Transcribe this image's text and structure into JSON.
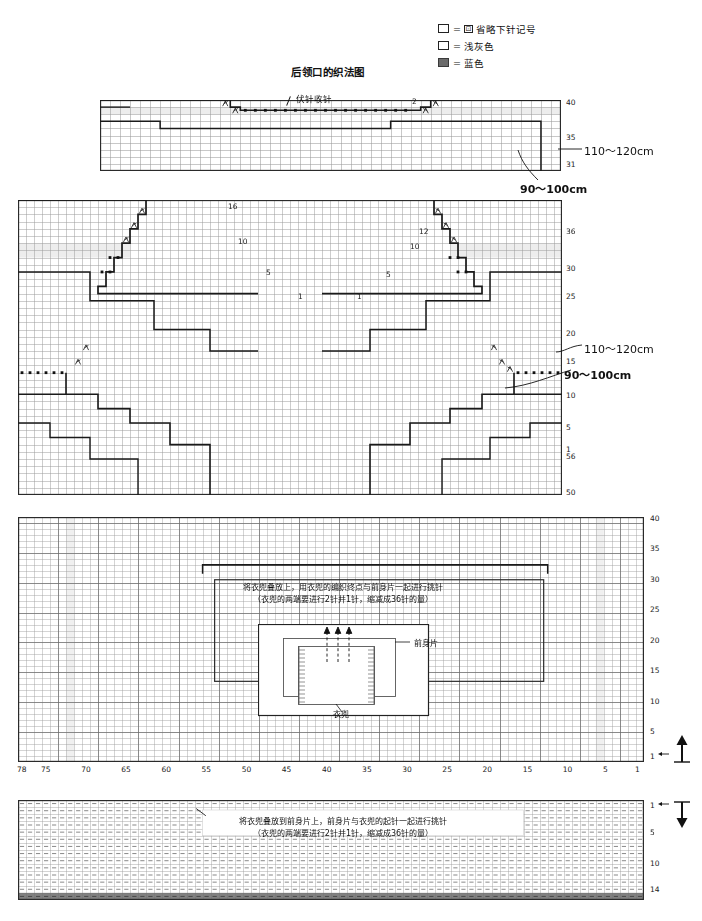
{
  "legend": {
    "rows": [
      {
        "swatch": "empty",
        "eq": "=",
        "mini": "⊡",
        "text": "省略下针记号"
      },
      {
        "swatch": "empty",
        "eq": "=",
        "mini": "",
        "text": "浅灰色"
      },
      {
        "swatch": "blue",
        "eq": "=",
        "mini": "",
        "text": "蓝色"
      }
    ],
    "blue_hex": "#6b6b6b"
  },
  "charts": [
    {
      "id": "back-neck",
      "title": "后领口的织法图",
      "annotations": [
        {
          "name": "bind-off",
          "text": "伏针收针"
        },
        {
          "name": "stitch-count-2",
          "text": "2"
        }
      ],
      "row_labels": [
        "40",
        "35",
        "31"
      ],
      "measure_right": "110～120cm",
      "measure_bottom": "90～100cm"
    },
    {
      "id": "front-body",
      "title": "前身片的织法图",
      "left_counts": [
        "16",
        "10",
        "5",
        "1"
      ],
      "right_counts": [
        "12",
        "10",
        "5",
        "1"
      ],
      "row_labels": [
        "36",
        "30",
        "25",
        "20",
        "15",
        "10",
        "5",
        "1",
        "56",
        "50"
      ],
      "measure_right": "110～120cm",
      "measure_bottom": "90～100cm"
    },
    {
      "id": "pocket-pickup-top",
      "title": "",
      "instruction_line1": "将衣兜叠放上，用衣兜的编织终点与前身片一起进行挑针",
      "instruction_line2": "（衣兜的两端要进行2针并1针，缩减成36针的量）",
      "schematic": {
        "front_label": "前身片",
        "pocket_label": "衣兜"
      },
      "row_labels": [
        "40",
        "35",
        "30",
        "25",
        "20",
        "15",
        "10",
        "5",
        "1"
      ],
      "col_labels": [
        "78",
        "75",
        "70",
        "65",
        "60",
        "55",
        "50",
        "45",
        "40",
        "35",
        "30",
        "25",
        "20",
        "15",
        "10",
        "5",
        "1"
      ],
      "direction": "up"
    },
    {
      "id": "pocket-pickup-bottom",
      "title": "",
      "instruction_line1": "将衣兜叠放到前身片上，前身片与衣兜的起针一起进行挑针",
      "instruction_line2": "（衣兜的两端要进行2针并1针，缩减成36针的量）",
      "row_labels": [
        "1",
        "5",
        "10",
        "14"
      ],
      "direction": "down"
    }
  ],
  "symbols": {
    "decrease": "入",
    "decrease_mirror": "𠆢",
    "bind_off_dot": "▪"
  }
}
